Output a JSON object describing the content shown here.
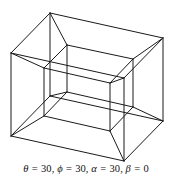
{
  "figure": {
    "stroke_color": "#1a1a1a",
    "background_color": "#ffffff",
    "stroke_width": 1
  },
  "caption": {
    "full_text": "θ = 30, ϕ = 30, α = 30, β = 0",
    "terms": [
      {
        "symbol": "θ",
        "equals": "=",
        "value": "30",
        "separator": ","
      },
      {
        "symbol": "ϕ",
        "equals": "=",
        "value": "30",
        "separator": ","
      },
      {
        "symbol": "α",
        "equals": "=",
        "value": "30",
        "separator": ","
      },
      {
        "symbol": "β",
        "equals": "=",
        "value": "0",
        "separator": ""
      }
    ]
  },
  "geometry": {
    "description": "Two nested cubes joined vertex-to-vertex (4D hypercube projection)",
    "outer_cube": {
      "name": "outer-cube",
      "vertices": {
        "v0": [
          11,
          53
        ],
        "v1": [
          50,
          13
        ],
        "v2": [
          163,
          38
        ],
        "v3": [
          124,
          78
        ],
        "v4": [
          11,
          136
        ],
        "v5": [
          50,
          96
        ],
        "v6": [
          163,
          121
        ],
        "v7": [
          124,
          161
        ]
      },
      "edges": [
        [
          "v0",
          "v1"
        ],
        [
          "v1",
          "v2"
        ],
        [
          "v2",
          "v3"
        ],
        [
          "v3",
          "v0"
        ],
        [
          "v4",
          "v5"
        ],
        [
          "v5",
          "v6"
        ],
        [
          "v6",
          "v7"
        ],
        [
          "v7",
          "v4"
        ],
        [
          "v0",
          "v4"
        ],
        [
          "v1",
          "v5"
        ],
        [
          "v2",
          "v6"
        ],
        [
          "v3",
          "v7"
        ]
      ]
    },
    "inner_cube": {
      "name": "inner-cube",
      "vertices": {
        "w0": [
          44,
          68
        ],
        "w1": [
          67,
          45
        ],
        "w2": [
          133,
          59
        ],
        "w3": [
          110,
          83
        ],
        "w4": [
          44,
          116
        ],
        "w5": [
          67,
          92
        ],
        "w6": [
          133,
          107
        ],
        "w7": [
          110,
          131
        ]
      },
      "edges": [
        [
          "w0",
          "w1"
        ],
        [
          "w1",
          "w2"
        ],
        [
          "w2",
          "w3"
        ],
        [
          "w3",
          "w0"
        ],
        [
          "w4",
          "w5"
        ],
        [
          "w5",
          "w6"
        ],
        [
          "w6",
          "w7"
        ],
        [
          "w7",
          "w4"
        ],
        [
          "w0",
          "w4"
        ],
        [
          "w1",
          "w5"
        ],
        [
          "w2",
          "w6"
        ],
        [
          "w3",
          "w7"
        ]
      ]
    },
    "connecting_edges": [
      [
        "v0",
        "w0"
      ],
      [
        "v1",
        "w1"
      ],
      [
        "v2",
        "w2"
      ],
      [
        "v3",
        "w3"
      ],
      [
        "v4",
        "w4"
      ],
      [
        "v5",
        "w5"
      ],
      [
        "v6",
        "w6"
      ],
      [
        "v7",
        "w7"
      ]
    ]
  }
}
